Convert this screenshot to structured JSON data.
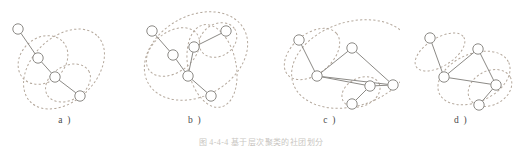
{
  "figure": {
    "caption": "图 4-4-4   基于层次聚类的社团划分",
    "colors": {
      "background": "#ffffff",
      "node_fill": "#ffffff",
      "node_stroke": "#8c8a86",
      "edge": "#8c8a86",
      "cluster_dashed": "#b4a89c",
      "label_text": "#4a4a4a"
    },
    "node_radius": 5.2,
    "panels": [
      {
        "id": "a",
        "label": "a )",
        "left": 0,
        "width": 130,
        "nodes": [
          {
            "id": "a1",
            "cx": 18,
            "cy": 29
          },
          {
            "id": "a2",
            "cx": 38,
            "cy": 58
          },
          {
            "id": "a3",
            "cx": 55,
            "cy": 77
          },
          {
            "id": "a4",
            "cx": 80,
            "cy": 96
          }
        ],
        "edges": [
          {
            "from": "a1",
            "to": "a2"
          },
          {
            "from": "a2",
            "to": "a3"
          },
          {
            "from": "a3",
            "to": "a4"
          }
        ],
        "clusters": [
          {
            "id": "a-c1",
            "cx": 43,
            "cy": 60,
            "rx": 27,
            "ry": 22,
            "rot": -42
          },
          {
            "id": "a-c2",
            "cx": 68,
            "cy": 83,
            "rx": 24,
            "ry": 17,
            "rot": -30
          },
          {
            "id": "a-c3",
            "cx": 64,
            "cy": 69,
            "rx": 47,
            "ry": 32,
            "rot": -44
          }
        ]
      },
      {
        "id": "b",
        "label": "b )",
        "left": 130,
        "width": 130,
        "nodes": [
          {
            "id": "b1",
            "cx": 22,
            "cy": 31
          },
          {
            "id": "b2",
            "cx": 43,
            "cy": 55
          },
          {
            "id": "b3",
            "cx": 64,
            "cy": 47
          },
          {
            "id": "b4",
            "cx": 96,
            "cy": 31
          },
          {
            "id": "b5",
            "cx": 58,
            "cy": 76
          },
          {
            "id": "b6",
            "cx": 81,
            "cy": 96
          }
        ],
        "edges": [
          {
            "from": "b1",
            "to": "b2"
          },
          {
            "from": "b2",
            "to": "b5"
          },
          {
            "from": "b3",
            "to": "b4"
          },
          {
            "from": "b3",
            "to": "b5"
          },
          {
            "from": "b5",
            "to": "b6"
          }
        ],
        "clusters": [
          {
            "id": "b-c1",
            "cx": 43,
            "cy": 52,
            "rx": 30,
            "ry": 20,
            "rot": -38
          },
          {
            "id": "b-c2",
            "cx": 88,
            "cy": 40,
            "rx": 20,
            "ry": 16,
            "rot": -34
          },
          {
            "id": "b-c3",
            "cx": 82,
            "cy": 66,
            "rx": 24,
            "ry": 42,
            "rot": -12
          },
          {
            "id": "b-c4",
            "cx": 66,
            "cy": 56,
            "rx": 55,
            "ry": 40,
            "rot": -30
          }
        ]
      },
      {
        "id": "c",
        "label": "c )",
        "left": 260,
        "width": 140,
        "nodes": [
          {
            "id": "c1",
            "cx": 39,
            "cy": 40
          },
          {
            "id": "c2",
            "cx": 57,
            "cy": 76
          },
          {
            "id": "c3",
            "cx": 92,
            "cy": 48
          },
          {
            "id": "c4",
            "cx": 110,
            "cy": 86
          },
          {
            "id": "c5",
            "cx": 92,
            "cy": 104
          },
          {
            "id": "c6",
            "cx": 133,
            "cy": 85
          }
        ],
        "edges": [
          {
            "from": "c1",
            "to": "c2"
          },
          {
            "from": "c2",
            "to": "c3"
          },
          {
            "from": "c2",
            "to": "c4"
          },
          {
            "from": "c2",
            "to": "c6"
          },
          {
            "from": "c3",
            "to": "c6"
          },
          {
            "from": "c4",
            "to": "c5"
          },
          {
            "from": "c4",
            "to": "c6"
          }
        ],
        "clusters": [
          {
            "id": "c-c1",
            "cx": 52,
            "cy": 54,
            "rx": 32,
            "ry": 20,
            "rot": -40
          },
          {
            "id": "c-c2",
            "cx": 101,
            "cy": 92,
            "rx": 20,
            "ry": 14,
            "rot": -25
          },
          {
            "id": "c-c3",
            "cx": 92,
            "cy": 64,
            "rx": 62,
            "ry": 42,
            "rot": -18
          }
        ]
      },
      {
        "id": "d",
        "label": "d )",
        "left": 400,
        "width": 122,
        "nodes": [
          {
            "id": "d1",
            "cx": 30,
            "cy": 38
          },
          {
            "id": "d2",
            "cx": 44,
            "cy": 77
          },
          {
            "id": "d3",
            "cx": 78,
            "cy": 49
          },
          {
            "id": "d4",
            "cx": 96,
            "cy": 85
          },
          {
            "id": "d5",
            "cx": 79,
            "cy": 105
          }
        ],
        "edges": [
          {
            "from": "d1",
            "to": "d2"
          },
          {
            "from": "d2",
            "to": "d3"
          },
          {
            "from": "d2",
            "to": "d4"
          },
          {
            "from": "d3",
            "to": "d4"
          },
          {
            "from": "d4",
            "to": "d5"
          }
        ],
        "clusters": [
          {
            "id": "d-c1",
            "cx": 40,
            "cy": 52,
            "rx": 28,
            "ry": 14,
            "rot": -32
          },
          {
            "id": "d-c2",
            "cx": 90,
            "cy": 88,
            "rx": 23,
            "ry": 17,
            "rot": -28
          },
          {
            "id": "d-c3",
            "cx": 74,
            "cy": 78,
            "rx": 38,
            "ry": 24,
            "rot": -24
          }
        ]
      }
    ]
  }
}
